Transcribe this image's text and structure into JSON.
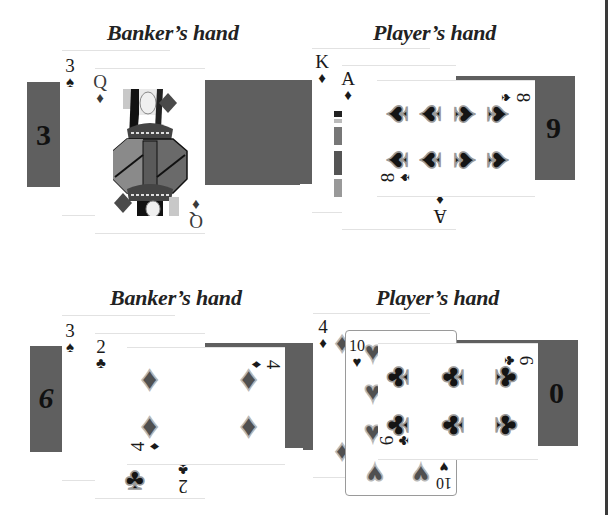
{
  "hands": [
    {
      "id": "top-banker",
      "title": "Banker’s hand",
      "score": "3",
      "cards": [
        {
          "rank": "3",
          "suit": "♠",
          "suit_name": "spades"
        },
        {
          "rank": "Q",
          "suit": "♦",
          "suit_name": "diamonds"
        }
      ]
    },
    {
      "id": "top-player",
      "title": "Player’s hand",
      "score": "9",
      "cards": [
        {
          "rank": "K",
          "suit": "♦",
          "suit_name": "diamonds"
        },
        {
          "rank": "A",
          "suit": "♦",
          "suit_name": "diamonds"
        },
        {
          "rank": "8",
          "suit": "♠",
          "suit_name": "spades"
        }
      ]
    },
    {
      "id": "bottom-banker",
      "title": "Banker’s hand",
      "score": "9",
      "cards": [
        {
          "rank": "3",
          "suit": "♠",
          "suit_name": "spades"
        },
        {
          "rank": "2",
          "suit": "♣",
          "suit_name": "clubs"
        },
        {
          "rank": "4",
          "suit": "♦",
          "suit_name": "diamonds"
        }
      ]
    },
    {
      "id": "bottom-player",
      "title": "Player’s hand",
      "score": "0",
      "cards": [
        {
          "rank": "4",
          "suit": "♦",
          "suit_name": "diamonds"
        },
        {
          "rank": "10",
          "suit": "♥",
          "suit_name": "hearts"
        },
        {
          "rank": "6",
          "suit": "♣",
          "suit_name": "clubs"
        }
      ]
    }
  ],
  "colors": {
    "score_box": "#5f5f5f",
    "background": "#ffffff",
    "ink": "#1a1a1a"
  }
}
